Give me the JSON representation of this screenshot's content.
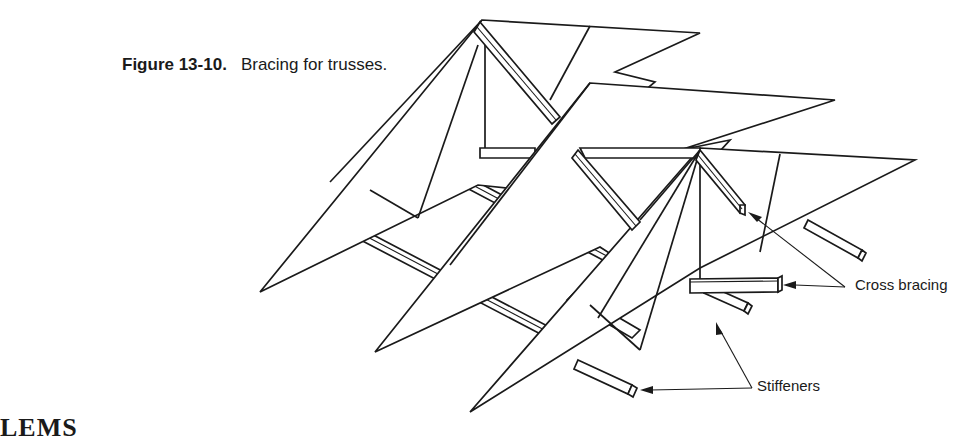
{
  "figure": {
    "number": "Figure 13-10.",
    "title": "Bracing for trusses.",
    "labels": {
      "cross_bracing": "Cross bracing",
      "stiffeners": "Stiffeners"
    }
  },
  "page": {
    "next_heading_fragment": "LEMS"
  }
}
